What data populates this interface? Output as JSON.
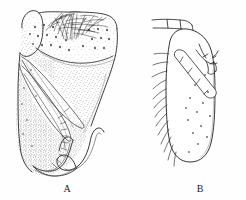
{
  "plate": {
    "type": "scientific-line-drawing",
    "background_color": "#fefefe",
    "ink_color": "#1a1a1a",
    "stipple_color": "#444444",
    "caption_font_size_px": 10,
    "figures": [
      {
        "id": "A",
        "label": "A",
        "label_x": 66,
        "label_y": 189,
        "description": "stippled lobed structure with dense dark setal brush at apex, scattered setal sockets, overlapping lamellae and a curved hook-like process at base",
        "features": [
          "apical dark setal brush",
          "scattered setal sockets",
          "overlapping lateral lamellae",
          "curved basal hook process",
          "stippled shading"
        ]
      },
      {
        "id": "B",
        "label": "B",
        "label_x": 199,
        "label_y": 189,
        "description": "outline drawing of elongate oval lobe with marginal setal fringe, scattered setal sockets and a segmented diagonal appendage with a narrow segmented bar at apex",
        "features": [
          "elongate oval lobe",
          "marginal setal fringe",
          "scattered setal sockets",
          "segmented diagonal appendage",
          "apical segmented bar"
        ]
      }
    ]
  }
}
